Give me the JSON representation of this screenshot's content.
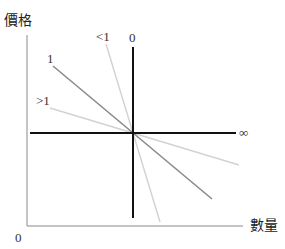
{
  "diagram": {
    "axes": {
      "y_label": "價格",
      "x_label": "數量",
      "origin_label": "0"
    },
    "lines": [
      {
        "id": "perfectly-inelastic",
        "label": "0",
        "color": "#111111",
        "from": [
          133,
          47
        ],
        "to": [
          133,
          218
        ],
        "width": 2
      },
      {
        "id": "perfectly-elastic",
        "label": "∞",
        "color": "#111111",
        "from": [
          30,
          133
        ],
        "to": [
          236,
          133
        ],
        "width": 2
      },
      {
        "id": "unit-elastic",
        "label": "1",
        "color": "#8a8a8a",
        "from": [
          53,
          66
        ],
        "to": [
          212,
          199
        ],
        "width": 1.6
      },
      {
        "id": "inelastic",
        "label": "<1",
        "color": "#cfcfcf",
        "from": [
          106,
          44
        ],
        "to": [
          160,
          222
        ],
        "width": 1.4
      },
      {
        "id": "elastic",
        "label": ">1",
        "color": "#cfcfcf",
        "from": [
          50,
          108
        ],
        "to": [
          239,
          165
        ],
        "width": 1.4
      }
    ],
    "colors": {
      "axis": "#888888",
      "bold_line": "#111111",
      "unit_line": "#8a8a8a",
      "light_line": "#cfcfcf",
      "text": "#333333"
    }
  }
}
